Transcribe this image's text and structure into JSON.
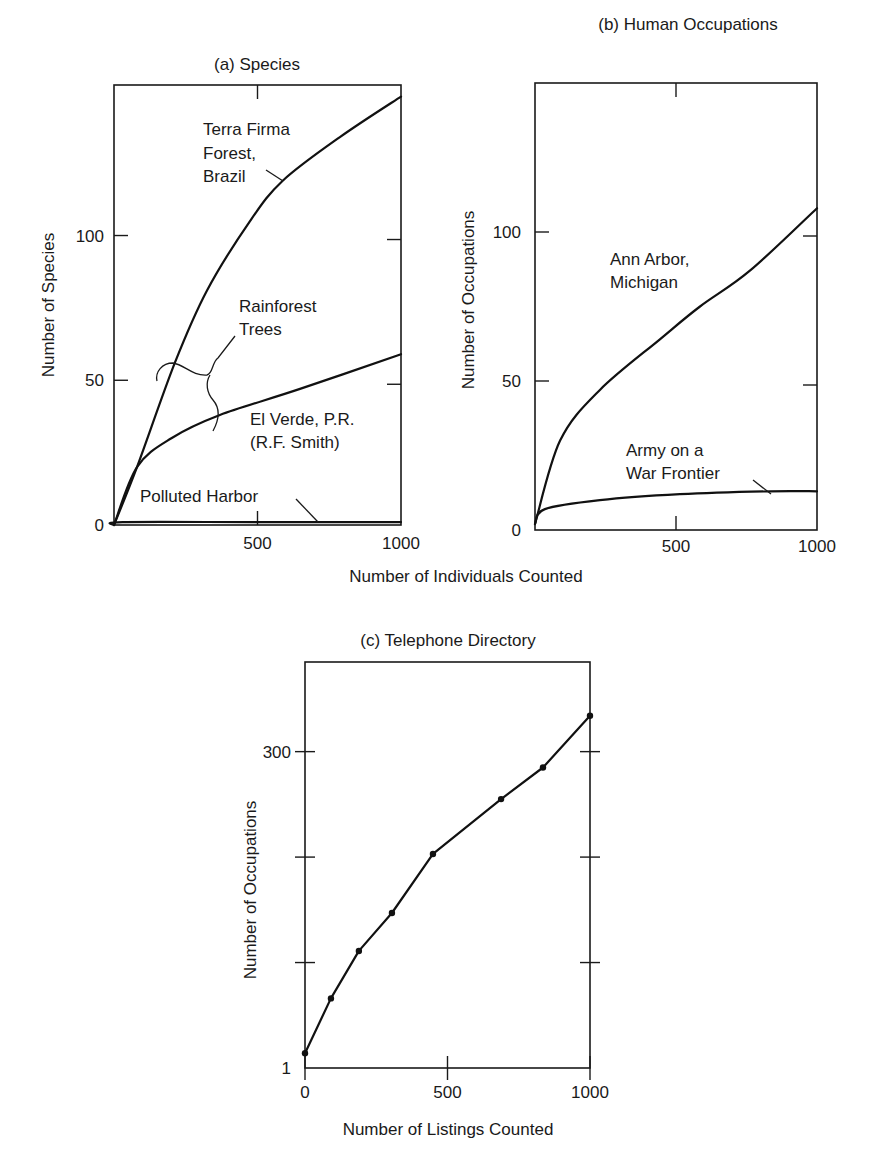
{
  "chart_data": [
    {
      "id": "a",
      "type": "line",
      "title": "(a)  Species",
      "xlabel": "Number of Individuals Counted",
      "ylabel": "Number of Species",
      "xlim": [
        0,
        1000
      ],
      "ylim": [
        0,
        152
      ],
      "x_ticks": [
        500,
        1000
      ],
      "x_tick_labels": [
        "500",
        "1000"
      ],
      "y_ticks": [
        0,
        50,
        100
      ],
      "y_tick_labels": [
        "0",
        "50",
        "100"
      ],
      "grid": false,
      "series": [
        {
          "name": "Terra Firma Forest, Brazil",
          "x": [
            0,
            80,
            212,
            324,
            474,
            589,
            787,
            1000
          ],
          "y": [
            0,
            20,
            56,
            81,
            105,
            119,
            134,
            148
          ]
        },
        {
          "name": "El Verde, P.R. (R.F. Smith)",
          "x": [
            0,
            80,
            200,
            369,
            648,
            1000
          ],
          "y": [
            0,
            20,
            30,
            38,
            47,
            59
          ]
        },
        {
          "name": "Polluted Harbor",
          "x": [
            0,
            30,
            500,
            1000
          ],
          "y": [
            0,
            1,
            1,
            1
          ]
        }
      ],
      "annotations": [
        {
          "text": [
            "Terra Firma",
            "Forest,",
            "Brazil"
          ],
          "target": "Terra Firma Forest, Brazil"
        },
        {
          "text": [
            "Rainforest",
            "Trees"
          ],
          "target": "bracket: Terra Firma & El Verde"
        },
        {
          "text": [
            "El Verde, P.R.",
            "(R.F. Smith)"
          ],
          "target": "El Verde, P.R. (R.F. Smith)"
        },
        {
          "text": [
            "Polluted Harbor"
          ],
          "target": "Polluted Harbor"
        }
      ]
    },
    {
      "id": "b",
      "type": "line",
      "title": "(b)  Human Occupations",
      "xlabel": "Number of Individuals Counted",
      "ylabel": "Number of Occupations",
      "xlim": [
        0,
        1000
      ],
      "ylim": [
        0,
        150
      ],
      "x_ticks": [
        500,
        1000
      ],
      "x_tick_labels": [
        "500",
        "1000"
      ],
      "y_ticks": [
        0,
        50,
        100
      ],
      "y_tick_labels": [
        "0",
        "50",
        "100"
      ],
      "grid": false,
      "series": [
        {
          "name": "Ann Arbor, Michigan",
          "x": [
            0,
            89,
            230,
            443,
            585,
            762,
            1000
          ],
          "y": [
            2,
            30,
            47,
            64,
            75,
            87,
            108
          ]
        },
        {
          "name": "Army on a War Frontier",
          "x": [
            0,
            35,
            230,
            514,
            833,
            1000
          ],
          "y": [
            2,
            7,
            10,
            12,
            13,
            13
          ]
        }
      ],
      "annotations": [
        {
          "text": [
            "Ann Arbor,",
            "Michigan"
          ],
          "target": "Ann Arbor, Michigan"
        },
        {
          "text": [
            "Army on a",
            "War Frontier"
          ],
          "target": "Army on a War Frontier"
        }
      ]
    },
    {
      "id": "c",
      "type": "line",
      "title": "(c)  Telephone Directory",
      "xlabel": "Number of Listings Counted",
      "ylabel": "Number of Occupations",
      "xlim": [
        0,
        1000
      ],
      "ylim": [
        0,
        385
      ],
      "x_ticks": [
        0,
        500,
        1000
      ],
      "x_tick_labels": [
        "0",
        "500",
        "1000"
      ],
      "y_ticks": [
        0,
        100,
        200,
        300
      ],
      "y_tick_labels": [
        "1",
        "",
        "",
        "300"
      ],
      "grid": false,
      "markers": true,
      "series": [
        {
          "name": "Telephone Directory",
          "x": [
            0,
            91,
            189,
            305,
            449,
            688,
            835,
            1000
          ],
          "y": [
            14,
            66,
            111,
            147,
            203,
            255,
            285,
            334
          ]
        }
      ]
    }
  ]
}
